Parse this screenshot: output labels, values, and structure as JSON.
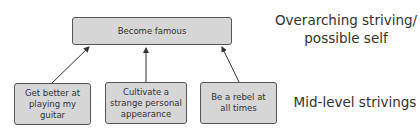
{
  "top_box": {
    "text": "Become famous"
  },
  "bottom_boxes": [
    {
      "text": "Get better at playing my guitar"
    },
    {
      "text": "Cultivate a strange personal appearance"
    },
    {
      "text": "Be a rebel at all times"
    }
  ],
  "labels": {
    "overarching_line1": "Overarching striving/",
    "overarching_line2": "possible self",
    "mid_level": "Mid-level strivings"
  },
  "colors": {
    "box_fill": "#d6d6d6",
    "box_border": "#555555",
    "arrow": "#333333"
  }
}
